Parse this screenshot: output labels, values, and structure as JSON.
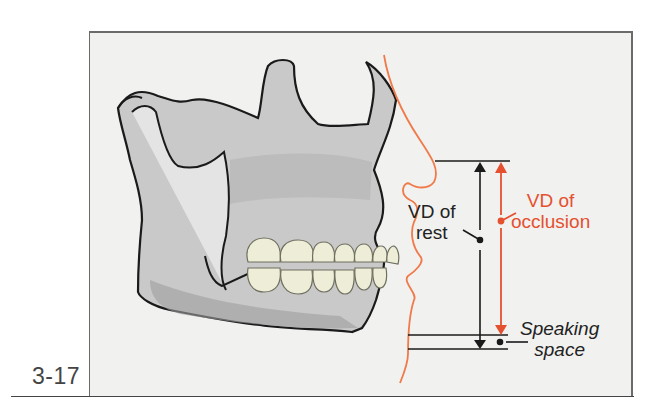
{
  "figure": {
    "number": "3-17",
    "labels": {
      "vd_rest": [
        "VD of",
        "rest"
      ],
      "vd_occlusion": [
        "VD of",
        "occlusion"
      ],
      "speaking_space": [
        "Speaking",
        "space"
      ]
    },
    "colors": {
      "occlusion_accent": "#e5502e",
      "profile_line": "#f07a4a",
      "bone": "#c4c4c4",
      "teeth": "#eeeed8",
      "background": "#f1f1f0"
    }
  }
}
